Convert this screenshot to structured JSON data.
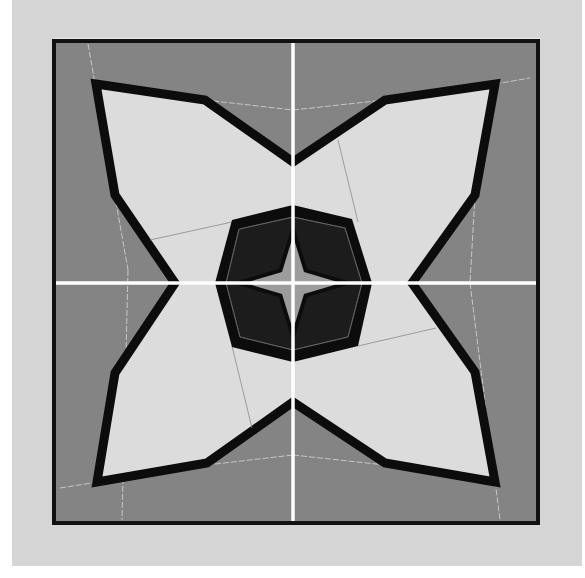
{
  "figure": {
    "colors": {
      "page": "#ffffff",
      "mat": "#d6d6d6",
      "frame_border": "#111111",
      "background_fabric": "#848484",
      "petal_fabric": "#dcdcdc",
      "outline": "#0c0c0c",
      "octagon_fill": "#1a1a1a",
      "center_star": "#9c9c9c",
      "seam_line_light": "#c8c8c8",
      "seam_line_dark": "#6a6a6a",
      "cross_line": "#ffffff"
    },
    "mat_rect": {
      "x": 12,
      "y": 0,
      "w": 570,
      "h": 566
    },
    "frame_rect": {
      "x": 54,
      "y": 41,
      "w": 484,
      "h": 482
    },
    "center": {
      "x": 293,
      "y": 283
    },
    "outer_star_points": "96,84 205,100 293,162 385,100 495,84 475,195 412,283 475,372 495,482 385,463 293,402 207,463 97,482 115,373 175,283 115,195",
    "octagon_points": "293,205 352,219 372,283 358,346 293,362 232,347 215,283 232,220",
    "octagon_inner_points": "293,217 345,228 362,283 348,337 293,350 240,337 226,283 239,229",
    "center_star_points": "293,236 304,272 341,283 304,294 293,330 282,294 245,283 282,272",
    "seam_lines": [
      {
        "x1": 88,
        "y1": 44,
        "x2": 128,
        "y2": 270
      },
      {
        "x1": 128,
        "y1": 270,
        "x2": 122,
        "y2": 520
      },
      {
        "x1": 205,
        "y1": 100,
        "x2": 293,
        "y2": 110
      },
      {
        "x1": 293,
        "y1": 110,
        "x2": 385,
        "y2": 100
      },
      {
        "x1": 495,
        "y1": 84,
        "x2": 530,
        "y2": 78
      },
      {
        "x1": 475,
        "y1": 195,
        "x2": 470,
        "y2": 283
      },
      {
        "x1": 470,
        "y1": 283,
        "x2": 500,
        "y2": 520
      },
      {
        "x1": 60,
        "y1": 488,
        "x2": 207,
        "y2": 465
      },
      {
        "x1": 293,
        "y1": 455,
        "x2": 385,
        "y2": 465
      },
      {
        "x1": 207,
        "y1": 465,
        "x2": 293,
        "y2": 455
      },
      {
        "x1": 338,
        "y1": 140,
        "x2": 358,
        "y2": 222
      },
      {
        "x1": 232,
        "y1": 346,
        "x2": 252,
        "y2": 428
      },
      {
        "x1": 150,
        "y1": 240,
        "x2": 232,
        "y2": 222
      },
      {
        "x1": 358,
        "y1": 346,
        "x2": 436,
        "y2": 328
      }
    ]
  }
}
